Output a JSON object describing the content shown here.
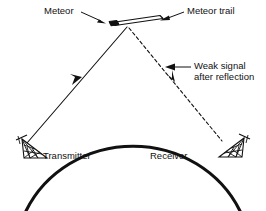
{
  "figure": {
    "type": "schematic-diagram",
    "background_color": "#ffffff",
    "ink_color": "#111111"
  },
  "labels": {
    "meteor": "Meteor",
    "meteor_trail": "Meteor trail",
    "weak_signal_line1": "Weak signal",
    "weak_signal_line2": "after reflection",
    "transmitter": "Transmitter",
    "receiver": "Receiver"
  },
  "elements": {
    "earth_arc_name": "earth-curvature-arc",
    "transmitted_ray_name": "transmitted-signal-ray",
    "reflected_ray_name": "reflected-signal-ray",
    "meteor_head_name": "meteor-head",
    "meteor_trail_shape_name": "meteor-trail-shape",
    "transmitter_antenna_name": "transmitter-antenna",
    "receiver_antenna_name": "receiver-antenna"
  }
}
